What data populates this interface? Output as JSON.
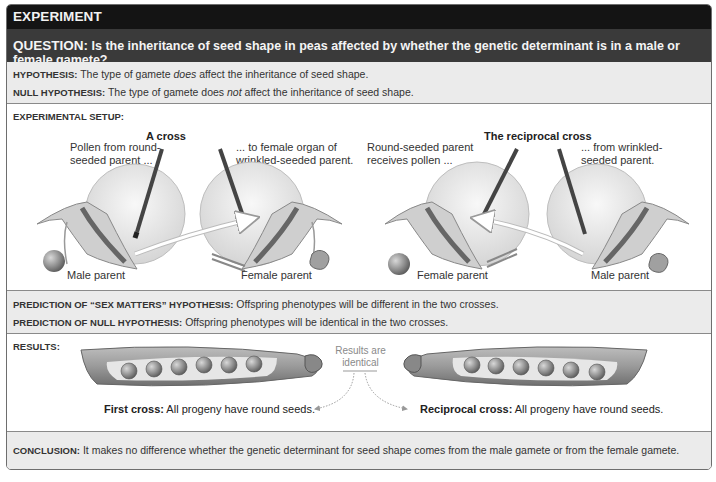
{
  "header": {
    "title": "EXPERIMENT"
  },
  "question": {
    "label": "QUESTION:",
    "text": " Is the inheritance of seed shape in peas affected by whether the genetic determinant is in a male or female gamete?"
  },
  "hypotheses": {
    "hypothesis": {
      "label": "HYPOTHESIS:",
      "pre": " The type of gamete ",
      "emph": "does",
      "post": " affect the inheritance of seed shape."
    },
    "null_hypothesis": {
      "label": "NULL HYPOTHESIS:",
      "pre": " The type of gamete does ",
      "emph": "not",
      "post": " affect the inheritance of seed shape."
    }
  },
  "setup": {
    "title": "EXPERIMENTAL SETUP:",
    "cross": {
      "title": "A cross",
      "left_caption_1": "Pollen from round-",
      "left_caption_2": "seeded parent ...",
      "right_caption_1": "... to female organ of",
      "right_caption_2": "wrinkled-seeded parent.",
      "left_parent": "Male parent",
      "right_parent": "Female parent"
    },
    "reciprocal": {
      "title": "The reciprocal cross",
      "left_caption_1": "Round-seeded parent",
      "left_caption_2": "receives pollen ...",
      "right_caption_1": "... from wrinkled-",
      "right_caption_2": "seeded parent.",
      "left_parent": "Female parent",
      "right_parent": "Male parent"
    }
  },
  "predictions": {
    "sex_matters": {
      "label": "PREDICTION OF “SEX MATTERS” HYPOTHESIS:",
      "text": " Offspring phenotypes will be different in the two crosses."
    },
    "null": {
      "label": "PREDICTION OF NULL HYPOTHESIS:",
      "text": " Offspring phenotypes will be identical in the two crosses."
    }
  },
  "results": {
    "title": "RESULTS:",
    "identical_1": "Results are",
    "identical_2": "identical",
    "first_label": "First cross:",
    "first_text": " All progeny have round seeds.",
    "reciprocal_label": "Reciprocal cross:",
    "reciprocal_text": " All progeny have round seeds."
  },
  "conclusion": {
    "label": "CONCLUSION:",
    "text": " It makes no difference whether the genetic determinant for seed shape comes from the male gamete or from the female gamete."
  }
}
